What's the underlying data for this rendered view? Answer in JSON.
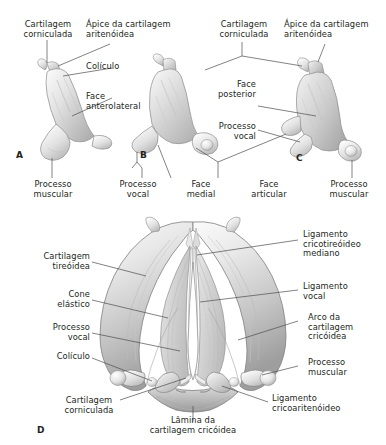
{
  "figure": {
    "background_color": "#ffffff",
    "ink_color": "#231f20",
    "leader_color": "#4d4d4d",
    "panels": [
      {
        "id": "A",
        "letter": "A",
        "view": "lateral esquerda da cartilagem aritenóidea"
      },
      {
        "id": "B",
        "letter": "B",
        "view": "anterior da cartilagem aritenóidea"
      },
      {
        "id": "C",
        "letter": "C",
        "view": "posteromedial da cartilagem aritenóidea"
      },
      {
        "id": "D",
        "letter": "D",
        "view": "superior do esqueleto da laringe"
      }
    ]
  },
  "labels": {
    "a_corniculada": "Cartilagem\ncorniculada",
    "a_apice": "Ápice da cartilagem\naritenóidea",
    "a_coliculo": "Colículo",
    "a_face_anterolateral": "Face\nanterolateral",
    "a_processo_muscular": "Processo\nmuscular",
    "b_processo_vocal": "Processo\nvocal",
    "b_face_medial": "Face\nmedial",
    "c_corniculada": "Cartilagem\ncorniculada",
    "c_apice": "Ápice da cartilagem\naritenóidea",
    "c_face_posterior": "Face\nposterior",
    "c_processo_vocal": "Processo\nvocal",
    "c_face_articular": "Face\narticular",
    "c_processo_muscular": "Processo\nmuscular",
    "d_cartilagem_tireoidea": "Cartilagem\ntireóidea",
    "d_cone_elastico": "Cone\nelástico",
    "d_processo_vocal": "Processo\nvocal",
    "d_coliculo": "Colículo",
    "d_cartilagem_corniculada": "Cartilagem\ncorniculada",
    "d_lamina_cricoidea": "Lâmina da\ncartilagem cricóidea",
    "d_lig_cricotireoideo": "Ligamento\ncricotireóideo\nmediano",
    "d_ligamento_vocal": "Ligamento\nvocal",
    "d_arco_cricoidea": "Arco da\ncartilagem\ncricóidea",
    "d_processo_muscular": "Processo\nmuscular",
    "d_lig_cricoaritenoideo": "Ligamento\ncricoaritenóideo"
  },
  "panel_letters": {
    "a": "A",
    "b": "B",
    "c": "C",
    "d": "D"
  }
}
